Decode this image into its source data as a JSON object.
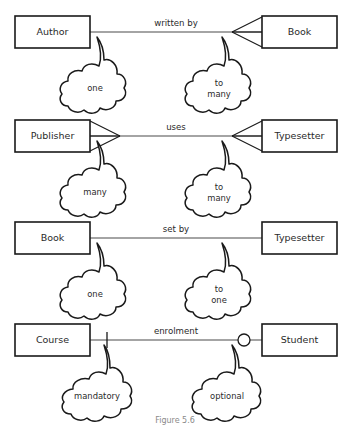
{
  "figure": {
    "caption": "Figure 5.6",
    "background": "#ffffff",
    "ink_color": "#1a1a1a"
  },
  "relationships": [
    {
      "id": "author-book",
      "left_entity": "Author",
      "right_entity": "Book",
      "relationship_label": "written by",
      "left_cardinality": "one",
      "right_cardinality": "to\nmany",
      "right_cardinality_line1": "to",
      "right_cardinality_line2": "many",
      "left_marker": "none",
      "right_marker": "crow-foot"
    },
    {
      "id": "publisher-typesetter",
      "left_entity": "Publisher",
      "right_entity": "Typesetter",
      "relationship_label": "uses",
      "left_cardinality": "many",
      "right_cardinality": "to\nmany",
      "right_cardinality_line1": "to",
      "right_cardinality_line2": "many",
      "left_marker": "crow-foot",
      "right_marker": "crow-foot"
    },
    {
      "id": "book-typesetter",
      "left_entity": "Book",
      "right_entity": "Typesetter",
      "relationship_label": "set by",
      "left_cardinality": "one",
      "right_cardinality": "to\none",
      "right_cardinality_line1": "to",
      "right_cardinality_line2": "one",
      "left_marker": "none",
      "right_marker": "none"
    },
    {
      "id": "course-student",
      "left_entity": "Course",
      "right_entity": "Student",
      "relationship_label": "enrolment",
      "left_cardinality": "mandatory",
      "right_cardinality": "optional",
      "left_marker": "tick",
      "right_marker": "circle"
    }
  ]
}
